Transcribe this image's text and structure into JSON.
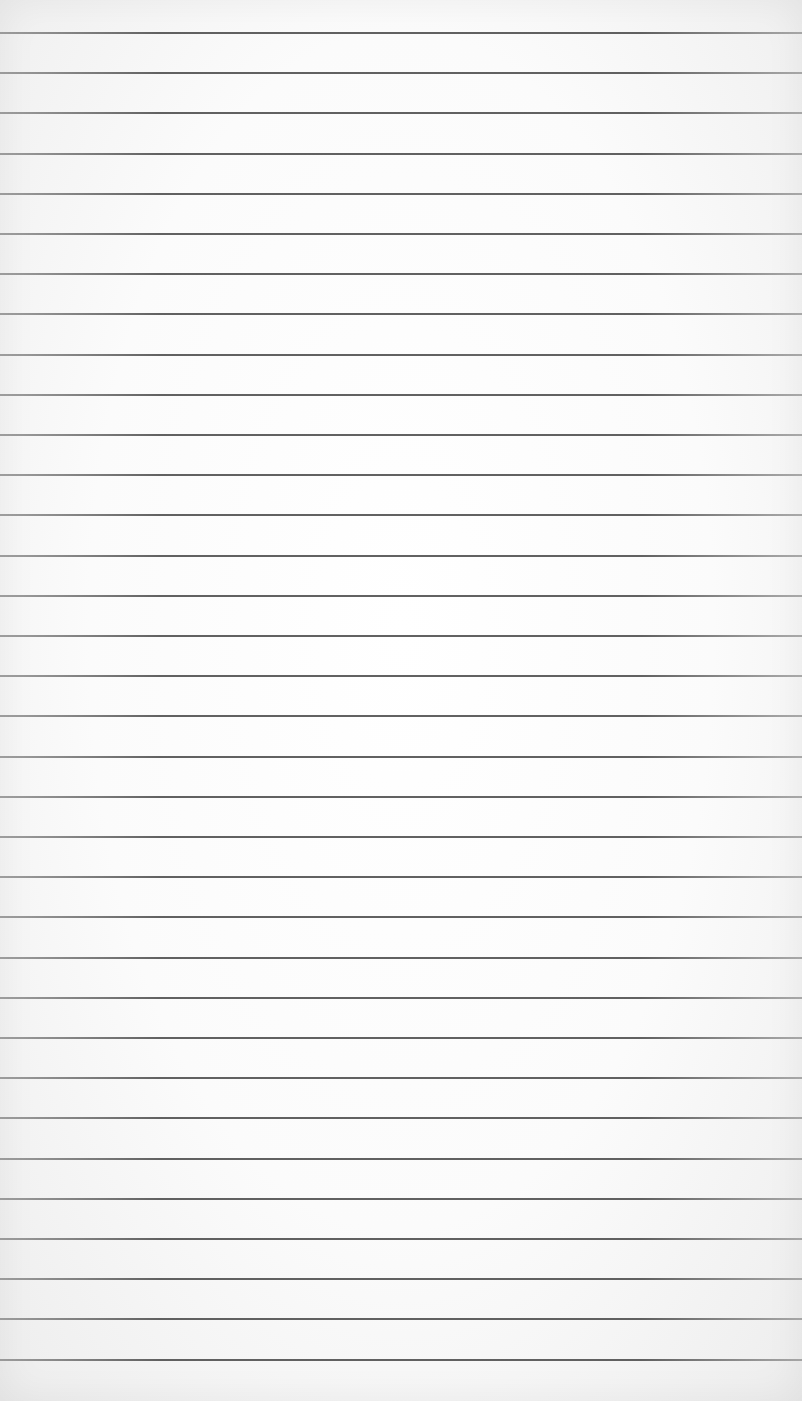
{
  "paper": {
    "type": "blank lined sheet",
    "background_color": "#fbfbfb",
    "line_color": "#4a4a4a",
    "line_count": 34,
    "first_line_y": 32,
    "line_spacing": 40.2,
    "text": ""
  }
}
